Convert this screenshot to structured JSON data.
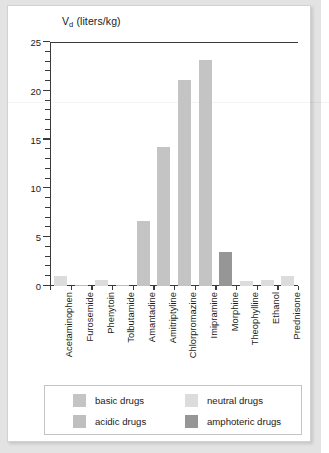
{
  "chart_data": {
    "type": "bar",
    "title": "",
    "ylabel": "V_d (liters/kg)",
    "ylabel_main": "V",
    "ylabel_sub": "d",
    "ylabel_unit": " (liters/kg)",
    "xlabel": "",
    "ylim": [
      0,
      25
    ],
    "ytick_values": [
      0,
      5,
      10,
      15,
      20,
      25
    ],
    "ytick_labels": [
      "0",
      "5",
      "10",
      "15",
      "20",
      "25"
    ],
    "minor_tick_interval": 1,
    "grid": false,
    "legend_position": "below-axes",
    "categories": [
      "Acetaminophen",
      "Furosemide",
      "Phenytoin",
      "Tolbutamide",
      "Amantadine",
      "Amitriptyline",
      "Chlorpromazine",
      "Imipramine",
      "Morphine",
      "Theophylline",
      "Ethanol",
      "Prednisone"
    ],
    "values": [
      1.0,
      0.1,
      0.6,
      0.1,
      6.7,
      14.2,
      21.1,
      23.2,
      3.5,
      0.5,
      0.6,
      1.0
    ],
    "bar_classes": [
      "neutral",
      "acidic",
      "neutral",
      "acidic",
      "basic",
      "basic",
      "basic",
      "basic",
      "amphoteric",
      "neutral",
      "neutral",
      "neutral"
    ],
    "series": [
      {
        "name": "V_d (liters/kg)",
        "values": [
          1.0,
          0.1,
          0.6,
          0.1,
          6.7,
          14.2,
          21.1,
          23.2,
          3.5,
          0.5,
          0.6,
          1.0
        ]
      }
    ],
    "legend": [
      {
        "label": "basic drugs",
        "key": "basic",
        "color": "#c4c4c4"
      },
      {
        "label": "neutral drugs",
        "key": "neutral",
        "color": "#dcdcdc"
      },
      {
        "label": "acidic drugs",
        "key": "acidic",
        "color": "#bfbfbf"
      },
      {
        "label": "amphoteric drugs",
        "key": "amphoteric",
        "color": "#969696"
      }
    ],
    "colors": {
      "basic": "#c4c4c4",
      "neutral": "#dcdcdc",
      "acidic": "#bfbfbf",
      "amphoteric": "#969696",
      "axis": "#3a3a3a",
      "frame": "#d2d2d2",
      "page": "#e3e3e3",
      "text": "#1a1a1a"
    }
  }
}
